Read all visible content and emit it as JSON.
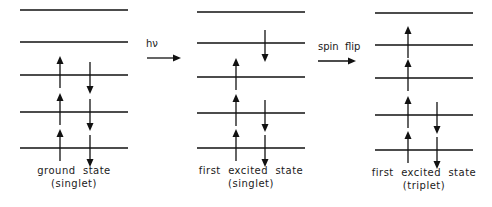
{
  "diagram": {
    "panels": [
      {
        "id": "ground",
        "label_line1": "ground  state",
        "label_line2": "(singlet)",
        "x1": 20,
        "x2": 128,
        "levels_y": [
          10,
          42,
          75,
          112,
          148
        ],
        "up_x": 60,
        "down_x": 90,
        "electrons": [
          {
            "level": 2,
            "spin": "up"
          },
          {
            "level": 2,
            "spin": "down"
          },
          {
            "level": 3,
            "spin": "up"
          },
          {
            "level": 3,
            "spin": "down"
          },
          {
            "level": 4,
            "spin": "up"
          },
          {
            "level": 4,
            "spin": "down"
          }
        ]
      },
      {
        "id": "singlet-excited",
        "label_line1": "first  excited  state",
        "label_line2": "(singlet)",
        "x1": 197,
        "x2": 305,
        "levels_y": [
          12,
          43,
          77,
          113,
          148
        ],
        "up_x": 236,
        "down_x": 265,
        "electrons": [
          {
            "level": 1,
            "spin": "down"
          },
          {
            "level": 2,
            "spin": "up"
          },
          {
            "level": 3,
            "spin": "up"
          },
          {
            "level": 3,
            "spin": "down"
          },
          {
            "level": 4,
            "spin": "up"
          },
          {
            "level": 4,
            "spin": "down"
          }
        ]
      },
      {
        "id": "triplet-excited",
        "label_line1": "first  excited  state",
        "label_line2": "(triplet)",
        "x1": 375,
        "x2": 473,
        "levels_y": [
          13,
          45,
          78,
          115,
          150
        ],
        "up_x": 408,
        "down_x": 437,
        "electrons": [
          {
            "level": 1,
            "spin": "up"
          },
          {
            "level": 2,
            "spin": "up"
          },
          {
            "level": 3,
            "spin": "up"
          },
          {
            "level": 3,
            "spin": "down"
          },
          {
            "level": 4,
            "spin": "up"
          },
          {
            "level": 4,
            "spin": "down"
          }
        ]
      }
    ],
    "transitions": [
      {
        "label": "hν",
        "x1": 147,
        "x2": 180,
        "y": 58,
        "label_x": 146,
        "label_y": 38
      },
      {
        "label": "spin  flip",
        "x1": 318,
        "x2": 355,
        "y": 61,
        "label_x": 318,
        "label_y": 41
      }
    ],
    "colors": {
      "line": "#111111",
      "background": "#ffffff"
    }
  }
}
